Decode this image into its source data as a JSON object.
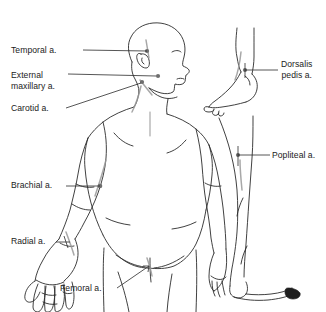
{
  "figure": {
    "background_color": "#ffffff",
    "line_color": "#2b2b2b",
    "artery_highlight_color": "#9a9a9a",
    "text_color": "#1b1b1b",
    "width": 326,
    "height": 312
  },
  "labels": {
    "temporal": "Temporal a.",
    "external_line1": "External",
    "external_line2": "maxillary a.",
    "carotid": "Carotid a.",
    "brachial": "Brachial a.",
    "radial": "Radial a.",
    "femoral": "Femoral a.",
    "dorsalis_line1": "Dorsalis",
    "dorsalis_line2": "pedis a.",
    "popliteal": "Popliteal a."
  },
  "anatomy": {
    "main_figure": "posterior full-body human figure, head in right profile",
    "inset_foot": "right foot in profile, medial view",
    "inset_leg": "right leg, posterior view with pointed toe"
  },
  "pressure_points": [
    {
      "name": "Temporal a.",
      "region": "temple, anterior to ear",
      "marker_x": 147,
      "marker_y": 51
    },
    {
      "name": "External maxillary a.",
      "region": "mandible, angle of jaw",
      "marker_x": 158,
      "marker_y": 76
    },
    {
      "name": "Carotid a.",
      "region": "lateral neck",
      "marker_x": 142,
      "marker_y": 82
    },
    {
      "name": "Brachial a.",
      "region": "medial upper arm",
      "marker_x": 100,
      "marker_y": 186
    },
    {
      "name": "Radial a.",
      "region": "wrist, thumb side",
      "marker_x": 62,
      "marker_y": 242
    },
    {
      "name": "Femoral a.",
      "region": "groin, inguinal crease",
      "marker_x": 143,
      "marker_y": 268
    },
    {
      "name": "Dorsalis pedis a.",
      "region": "dorsum of foot, ankle",
      "marker_x": 245,
      "marker_y": 70
    },
    {
      "name": "Popliteal a.",
      "region": "behind the knee",
      "marker_x": 238,
      "marker_y": 155
    }
  ]
}
